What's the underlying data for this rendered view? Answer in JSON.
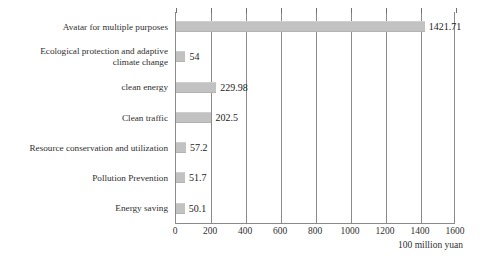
{
  "chart_data": {
    "type": "bar",
    "orientation": "horizontal",
    "title": "",
    "xlabel": "100 million yuan",
    "ylabel": "",
    "xlim": [
      0,
      1600
    ],
    "xticks": [
      0,
      200,
      400,
      600,
      800,
      1000,
      1200,
      1400,
      1600
    ],
    "xtick_labels": [
      "0",
      "200",
      "400",
      "600",
      "800",
      "1000",
      "1200",
      "1400",
      "1600"
    ],
    "grid": "vertical",
    "legend": "none",
    "bar_color": "#c2c2c2",
    "categories": [
      "Avatar for multiple purposes",
      "Ecological protection and adaptive\nclimate change",
      "clean energy",
      "Clean traffic",
      "Resource conservation and utilization",
      "Pollution Prevention",
      "Energy saving"
    ],
    "values": [
      1421.71,
      54,
      229.98,
      202.5,
      57.2,
      51.7,
      50.1
    ],
    "value_labels": [
      "1421.71",
      "54",
      "229.98",
      "202.5",
      "57.2",
      "51.7",
      "50.1"
    ]
  }
}
